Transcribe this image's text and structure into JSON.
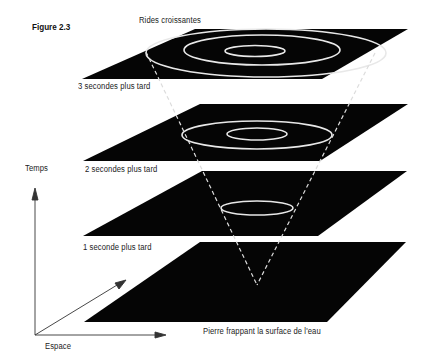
{
  "figure": {
    "label": "Figure 2.3",
    "top_caption": "Rides croissantes",
    "bottom_caption": "Pierre frappant la surface de l'eau"
  },
  "planes": [
    {
      "label": "3 secondes plus tard",
      "rings": 3
    },
    {
      "label": "2 secondes plus tard",
      "rings": 2
    },
    {
      "label": "1 seconde plus tard",
      "rings": 1
    },
    {
      "label": "",
      "rings": 0
    }
  ],
  "axes": {
    "vertical": "Temps",
    "horizontal": "Espace"
  },
  "colors": {
    "plane": "#050505",
    "ring": "#e8e8e8",
    "cone_line": "#dcdcdc",
    "axis": "#333333",
    "background": "#ffffff"
  }
}
